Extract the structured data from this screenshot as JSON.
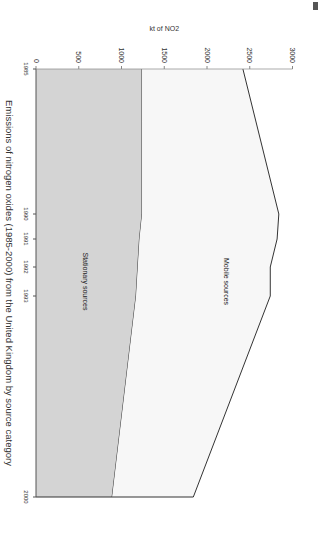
{
  "chart_data": {
    "type": "area",
    "title": "Emissions of nitrogen oxides (1985-2000) from the United Kingdom by source category",
    "xlabel": "",
    "ylabel": "kt of NO2",
    "x": [
      1985,
      1990,
      1991,
      1992,
      1993,
      2000
    ],
    "x_tick_labels": [
      "1985",
      "1990",
      "1991",
      "1992",
      "1993",
      "2000"
    ],
    "y_ticks": [
      0,
      500,
      1000,
      1500,
      2000,
      2500,
      3000
    ],
    "ylim": [
      0,
      3000
    ],
    "stacked": true,
    "series": [
      {
        "name": "Stationary sources",
        "values": [
          1240,
          1240,
          1210,
          1190,
          1170,
          890
        ],
        "color": "#d4d4d4"
      },
      {
        "name": "Mobile sources",
        "values": [
          1180,
          1600,
          1610,
          1550,
          1570,
          950
        ],
        "color": "#f7f7f7"
      }
    ],
    "annotations": [
      "Mobile sources",
      "Stationary sources"
    ],
    "orientation": "rotated 90 degrees clockwise"
  }
}
